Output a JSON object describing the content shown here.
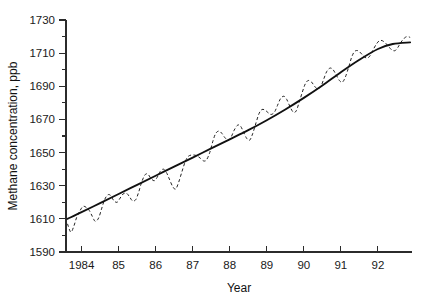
{
  "chart_data": {
    "type": "line",
    "title": "",
    "xlabel": "Year",
    "ylabel": "Methane concentration, ppb",
    "xlim": [
      1983.58,
      1992.92
    ],
    "ylim": [
      1590,
      1730
    ],
    "grid": false,
    "legend": "none",
    "y_ticks_major": [
      1590,
      1610,
      1630,
      1650,
      1670,
      1690,
      1710,
      1730
    ],
    "y_ticks_minor": [
      1600,
      1620,
      1640,
      1660,
      1680,
      1700,
      1720
    ],
    "y_tick_labels": [
      "1590",
      "1610",
      "1630",
      "1650",
      "1670",
      "1690",
      "1710",
      "1730"
    ],
    "x_ticks": [
      1984,
      1985,
      1986,
      1987,
      1988,
      1989,
      1990,
      1991,
      1992
    ],
    "x_tick_labels": [
      "1984",
      "85",
      "86",
      "87",
      "88",
      "89",
      "90",
      "91",
      "92"
    ],
    "series": [
      {
        "name": "Monthly mean methane concentration",
        "style": "dashed",
        "color": "#222222",
        "x": [
          1983.62,
          1983.71,
          1983.79,
          1983.87,
          1983.96,
          1984.04,
          1984.12,
          1984.21,
          1984.29,
          1984.37,
          1984.46,
          1984.54,
          1984.62,
          1984.71,
          1984.79,
          1984.87,
          1984.96,
          1985.04,
          1985.12,
          1985.21,
          1985.29,
          1985.37,
          1985.46,
          1985.54,
          1985.62,
          1985.71,
          1985.79,
          1985.87,
          1985.96,
          1986.04,
          1986.12,
          1986.21,
          1986.29,
          1986.37,
          1986.46,
          1986.54,
          1986.62,
          1986.71,
          1986.79,
          1986.87,
          1986.96,
          1987.04,
          1987.12,
          1987.21,
          1987.29,
          1987.37,
          1987.46,
          1987.54,
          1987.62,
          1987.71,
          1987.79,
          1987.87,
          1987.96,
          1988.04,
          1988.12,
          1988.21,
          1988.29,
          1988.37,
          1988.46,
          1988.54,
          1988.62,
          1988.71,
          1988.79,
          1988.87,
          1988.96,
          1989.04,
          1989.12,
          1989.21,
          1989.29,
          1989.37,
          1989.46,
          1989.54,
          1989.62,
          1989.71,
          1989.79,
          1989.87,
          1989.96,
          1990.04,
          1990.12,
          1990.21,
          1990.29,
          1990.37,
          1990.46,
          1990.54,
          1990.62,
          1990.71,
          1990.79,
          1990.87,
          1990.96,
          1991.04,
          1991.12,
          1991.21,
          1991.29,
          1991.37,
          1991.46,
          1991.54,
          1991.62,
          1991.71,
          1991.79,
          1991.87,
          1991.96,
          1992.04,
          1992.12,
          1992.21,
          1992.29,
          1992.37,
          1992.46,
          1992.54,
          1992.62,
          1992.71,
          1992.79,
          1992.87
        ],
        "y": [
          1607.0,
          1602.0,
          1605.5,
          1611.0,
          1615.0,
          1617.5,
          1617.0,
          1615.0,
          1611.5,
          1608.5,
          1610.5,
          1616.0,
          1621.5,
          1624.5,
          1624.0,
          1621.0,
          1620.0,
          1622.5,
          1625.0,
          1625.5,
          1623.5,
          1621.0,
          1621.5,
          1626.0,
          1632.0,
          1636.5,
          1637.0,
          1634.5,
          1633.0,
          1635.0,
          1638.5,
          1640.0,
          1638.0,
          1634.0,
          1629.5,
          1628.0,
          1632.0,
          1638.5,
          1644.0,
          1647.5,
          1648.5,
          1648.5,
          1648.0,
          1646.5,
          1645.0,
          1645.5,
          1650.0,
          1656.5,
          1661.5,
          1663.0,
          1661.5,
          1659.0,
          1657.5,
          1659.5,
          1663.5,
          1666.5,
          1666.0,
          1662.5,
          1658.5,
          1657.5,
          1661.5,
          1668.0,
          1673.5,
          1676.0,
          1675.5,
          1674.0,
          1673.0,
          1674.5,
          1678.5,
          1682.5,
          1684.0,
          1682.0,
          1678.0,
          1674.5,
          1675.0,
          1680.0,
          1686.5,
          1691.5,
          1693.5,
          1692.5,
          1690.0,
          1688.5,
          1690.0,
          1694.5,
          1699.0,
          1701.0,
          1700.0,
          1697.0,
          1693.5,
          1692.5,
          1695.5,
          1701.5,
          1707.5,
          1711.0,
          1711.5,
          1710.0,
          1708.0,
          1707.0,
          1708.5,
          1712.0,
          1715.5,
          1717.5,
          1717.5,
          1716.0,
          1714.0,
          1712.0,
          1711.5,
          1713.5,
          1716.5,
          1719.0,
          1720.0,
          1719.5
        ]
      },
      {
        "name": "Smoothed trend",
        "style": "solid",
        "color": "#111111",
        "x": [
          1983.62,
          1984.0,
          1984.5,
          1985.0,
          1985.5,
          1986.0,
          1986.5,
          1987.0,
          1987.5,
          1988.0,
          1988.5,
          1989.0,
          1989.5,
          1990.0,
          1990.5,
          1991.0,
          1991.5,
          1992.0,
          1992.4,
          1992.87
        ],
        "y": [
          1610.0,
          1614.0,
          1619.5,
          1625.0,
          1630.5,
          1636.0,
          1641.5,
          1647.0,
          1652.5,
          1658.0,
          1663.5,
          1669.5,
          1676.0,
          1683.0,
          1690.5,
          1698.5,
          1706.0,
          1712.5,
          1715.5,
          1716.5
        ]
      }
    ]
  },
  "axes": {
    "y_title": "Methane concentration, ppb",
    "x_title": "Year"
  }
}
